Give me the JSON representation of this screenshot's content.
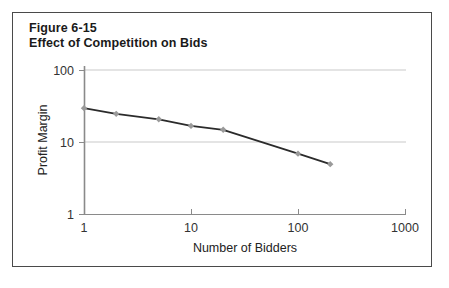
{
  "figure": {
    "label": "Figure 6-15",
    "title": "Effect of Competition on Bids",
    "border_color": "#4a4a4a",
    "background": "#ffffff"
  },
  "chart_data": {
    "type": "line",
    "title": "Effect of Competition on Bids",
    "subtitle": "Figure 6-15",
    "xlabel": "Number of Bidders",
    "ylabel": "Profit Margin",
    "xscale": "log",
    "yscale": "log",
    "xlim": [
      1,
      1000
    ],
    "ylim": [
      1,
      100
    ],
    "xticks": [
      1,
      10,
      100,
      1000
    ],
    "xtick_labels": [
      "1",
      "10",
      "100",
      "1000"
    ],
    "yticks": [
      1,
      10,
      100
    ],
    "ytick_labels": [
      "1",
      "10",
      "100"
    ],
    "grid": "horizontal",
    "legend": "none",
    "series": [
      {
        "name": "Profit Margin",
        "line_color": "#2b2b2b",
        "marker_color": "#9a9a9a",
        "marker": "diamond",
        "x": [
          1,
          2,
          5,
          10,
          20,
          100,
          200
        ],
        "y": [
          30,
          25,
          21,
          17,
          15,
          7,
          5
        ]
      }
    ],
    "points": [
      {
        "bidders": 1,
        "margin": 30
      },
      {
        "bidders": 2,
        "margin": 25
      },
      {
        "bidders": 5,
        "margin": 21
      },
      {
        "bidders": 10,
        "margin": 17
      },
      {
        "bidders": 20,
        "margin": 15
      },
      {
        "bidders": 100,
        "margin": 7
      },
      {
        "bidders": 200,
        "margin": 5
      }
    ]
  },
  "colors": {
    "axis": "#8a8a8a",
    "grid": "#c9c9c9",
    "text": "#222222",
    "line": "#2b2b2b",
    "marker": "#9a9a9a"
  }
}
